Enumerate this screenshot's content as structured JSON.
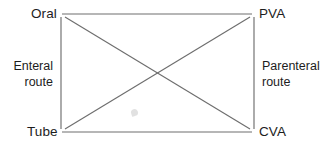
{
  "diagram": {
    "type": "node-link",
    "background_color": "#ffffff",
    "line_color": "#6e6e6e",
    "text_color": "#1d1d1d",
    "nodes": [
      {
        "id": "oral",
        "label": "Oral",
        "position": "top-left",
        "x": 62,
        "y": 14
      },
      {
        "id": "pva",
        "label": "PVA",
        "position": "top-right",
        "x": 252,
        "y": 14
      },
      {
        "id": "tube",
        "label": "Tube",
        "position": "bottom-left",
        "x": 62,
        "y": 132
      },
      {
        "id": "cva",
        "label": "CVA",
        "position": "bottom-right",
        "x": 252,
        "y": 132
      }
    ],
    "edges": [
      {
        "from": "oral",
        "to": "pva",
        "kind": "horizontal-top"
      },
      {
        "from": "tube",
        "to": "cva",
        "kind": "horizontal-bottom"
      },
      {
        "from": "oral",
        "to": "tube",
        "kind": "vertical-left"
      },
      {
        "from": "pva",
        "to": "cva",
        "kind": "vertical-right"
      },
      {
        "from": "oral",
        "to": "cva",
        "kind": "diagonal"
      },
      {
        "from": "tube",
        "to": "pva",
        "kind": "diagonal"
      }
    ],
    "side_labels": {
      "left": {
        "line1": "Enteral",
        "line2": "route"
      },
      "right": {
        "line1": "Parenteral",
        "line2": "route"
      }
    }
  }
}
